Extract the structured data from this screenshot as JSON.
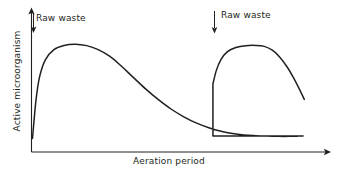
{
  "chart_data": {
    "type": "line",
    "title": "",
    "xlabel": "Aeration period",
    "ylabel": "Active microorganism",
    "grid": false,
    "legend": null,
    "axis_style": "arrow-terminated open axes",
    "xlim": [
      0,
      1
    ],
    "ylim": [
      0,
      1
    ],
    "annotations": [
      {
        "label": "Raw waste",
        "arrow": "down",
        "x_norm": 0.03,
        "text_x_norm": 0.04
      },
      {
        "label": "Raw waste",
        "arrow": "down",
        "x_norm": 0.63,
        "text_x_norm": 0.66
      }
    ],
    "series": [
      {
        "name": "Active microorganism",
        "color": "#231f20",
        "points": [
          [
            0.0,
            0.105
          ],
          [
            0.012,
            0.42
          ],
          [
            0.025,
            0.62
          ],
          [
            0.045,
            0.76
          ],
          [
            0.075,
            0.845
          ],
          [
            0.11,
            0.88
          ],
          [
            0.15,
            0.89
          ],
          [
            0.19,
            0.878
          ],
          [
            0.23,
            0.845
          ],
          [
            0.27,
            0.79
          ],
          [
            0.31,
            0.71
          ],
          [
            0.35,
            0.62
          ],
          [
            0.395,
            0.52
          ],
          [
            0.44,
            0.43
          ],
          [
            0.485,
            0.35
          ],
          [
            0.53,
            0.285
          ],
          [
            0.575,
            0.232
          ],
          [
            0.62,
            0.192
          ],
          [
            0.66,
            0.165
          ],
          [
            0.7,
            0.146
          ],
          [
            0.74,
            0.134
          ],
          [
            0.78,
            0.128
          ],
          [
            0.82,
            0.124
          ],
          [
            0.86,
            0.122
          ],
          [
            0.9,
            0.122
          ],
          [
            0.93,
            0.124
          ],
          [
            0.948,
            0.126
          ]
        ]
      }
    ],
    "cycle2": {
      "step_x_norm": 0.632,
      "step_from_y": 0.126,
      "step_to_y": 0.56,
      "peak_x_norm": 0.782,
      "peak_y": 0.88,
      "end_x_norm": 0.952,
      "end_y": 0.43
    }
  },
  "figure": {
    "background": "#ffffff",
    "line_color": "#231f20",
    "axis_color": "#231f20",
    "text_color": "#231f20"
  }
}
